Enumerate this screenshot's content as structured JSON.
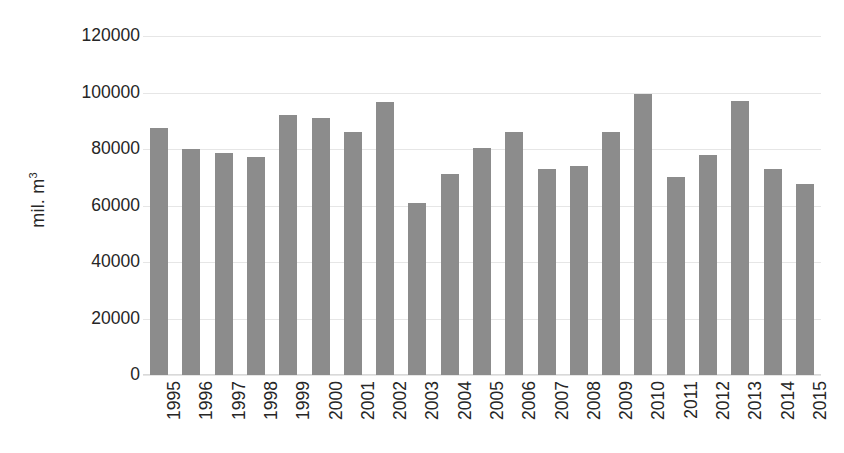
{
  "chart_data": {
    "type": "bar",
    "title": "",
    "subtitle": "",
    "xlabel": "",
    "ylabel": "mil. m",
    "ylabel_superscript": "3",
    "categories": [
      "1995",
      "1996",
      "1997",
      "1998",
      "1999",
      "2000",
      "2001",
      "2002",
      "2003",
      "2004",
      "2005",
      "2006",
      "2007",
      "2008",
      "2009",
      "2010",
      "2011",
      "2012",
      "2013",
      "2014",
      "2015"
    ],
    "values": [
      87500,
      80000,
      78500,
      77000,
      92000,
      91000,
      86000,
      96500,
      61000,
      71000,
      80500,
      86000,
      73000,
      74000,
      86000,
      99400,
      70000,
      78000,
      97000,
      73000,
      67500
    ],
    "series": [
      {
        "name": "mil. m3",
        "values": [
          87500,
          80000,
          78500,
          77000,
          92000,
          91000,
          86000,
          96500,
          61000,
          71000,
          80500,
          86000,
          73000,
          74000,
          86000,
          99400,
          70000,
          78000,
          97000,
          73000,
          67500
        ]
      }
    ],
    "ylim": [
      0,
      120000
    ],
    "ytick_values": [
      0,
      20000,
      40000,
      60000,
      80000,
      100000,
      120000
    ],
    "ytick_labels": [
      "0",
      "20000",
      "40000",
      "60000",
      "80000",
      "100000",
      "120000"
    ],
    "grid": true,
    "grid_axis": "y",
    "legend": false,
    "legend_position": "none",
    "bar_color": "#8c8c8c",
    "gridline_color": "#e6e6e6",
    "background_color": "#ffffff",
    "text_color": "#262626",
    "xtick_rotation": -90
  }
}
